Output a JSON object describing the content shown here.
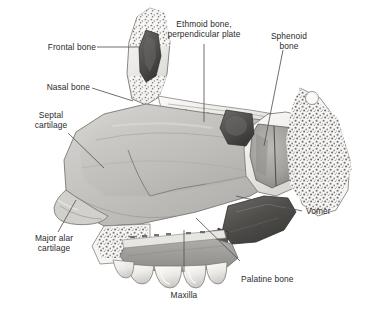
{
  "figure": {
    "type": "anatomical-illustration",
    "view": "left lateral / midsagittal",
    "style": "grayscale medical illustration",
    "background_color": "#ffffff",
    "text_color": "#2b2b2b",
    "leader_line_color": "#555555"
  },
  "labels": [
    {
      "id": "frontal-bone",
      "text": "Frontal bone",
      "lines": [
        "Frontal bone"
      ]
    },
    {
      "id": "nasal-bone",
      "text": "Nasal bone",
      "lines": [
        "Nasal bone"
      ]
    },
    {
      "id": "septal-cartilage",
      "text": "Septal cartilage",
      "lines": [
        "Septal",
        "cartilage"
      ]
    },
    {
      "id": "major-alar-cartilage",
      "text": "Major alar cartilage",
      "lines": [
        "Major alar",
        "cartilage"
      ]
    },
    {
      "id": "ethmoid-bone",
      "text": "Ethmoid bone, perpendicular plate",
      "lines": [
        "Ethmoid bone,",
        "perpendicular plate"
      ]
    },
    {
      "id": "sphenoid-bone",
      "text": "Sphenoid bone",
      "lines": [
        "Sphenoid",
        "bone"
      ]
    },
    {
      "id": "vomer",
      "text": "Vomer",
      "lines": [
        "Vomer"
      ]
    },
    {
      "id": "palatine-bone",
      "text": "Palatine bone",
      "lines": [
        "Palatine bone"
      ]
    },
    {
      "id": "maxilla",
      "text": "Maxilla",
      "lines": [
        "Maxilla"
      ]
    }
  ],
  "structures": [
    {
      "id": "frontal-sinus",
      "name": "Frontal sinus (dark cavity in frontal bone)"
    },
    {
      "id": "sphenoid-sinus",
      "name": "Sphenoid sinus (dark cavity)"
    },
    {
      "id": "trabecular-bone",
      "name": "Cancellous / trabecular bone stipple"
    },
    {
      "id": "teeth-row",
      "name": "Upper dental arch (maxillary teeth)"
    },
    {
      "id": "hard-palate",
      "name": "Hard palate"
    }
  ]
}
